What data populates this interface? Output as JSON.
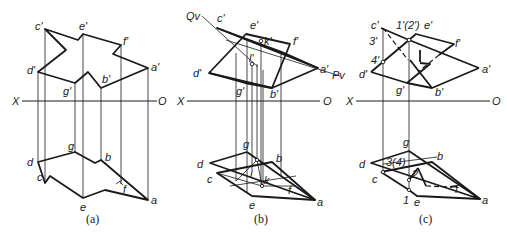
{
  "figure": {
    "panels": [
      {
        "id": "a",
        "caption": "(a)",
        "axis": {
          "left": "X",
          "right": "O"
        },
        "front_view_labels": {
          "c": "c'",
          "e": "e'",
          "f": "f'",
          "d": "d'",
          "g": "g'",
          "b": "b'",
          "a": "a'"
        },
        "top_view_labels": {
          "g": "g",
          "b": "b",
          "d": "d",
          "c": "c",
          "f": "f",
          "e": "e",
          "a": "a"
        }
      },
      {
        "id": "b",
        "caption": "(b)",
        "axis": {
          "left": "X",
          "right": "O"
        },
        "plane_traces": {
          "q": "Qv",
          "p": "Pv"
        },
        "front_view_labels": {
          "c": "c'",
          "e": "e'",
          "k": "k'",
          "f": "f'",
          "l": "l'",
          "d": "d'",
          "a": "a'",
          "g": "g'",
          "b": "b'"
        },
        "top_view_labels": {
          "g": "g",
          "b": "b",
          "d": "d",
          "l": "l",
          "c": "c",
          "k": "k",
          "f": "f",
          "e": "e",
          "a": "a"
        }
      },
      {
        "id": "c",
        "caption": "(c)",
        "axis": {
          "left": "X",
          "right": "O"
        },
        "front_view_labels": {
          "c": "c'",
          "p12": "1'(2')",
          "e": "e'",
          "p3": "3'",
          "f": "f'",
          "p4": "4'",
          "d": "d'",
          "a": "a'",
          "g": "g'",
          "b": "b'"
        },
        "top_view_labels": {
          "g": "g",
          "b": "b",
          "d": "d",
          "p34": "3(4)",
          "c": "c",
          "p2": "2",
          "f": "f",
          "p1": "1",
          "e": "e",
          "a": "a"
        }
      }
    ]
  }
}
